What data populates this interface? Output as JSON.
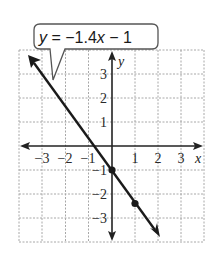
{
  "figure": {
    "equation": {
      "y_var": "y",
      "equals": " = −1.4",
      "x_var": "x",
      "rest": " − 1"
    },
    "axes": {
      "x_label": "x",
      "y_label": "y",
      "x_ticks": [
        "−3",
        "−2",
        "−1",
        "1",
        "2",
        "3"
      ],
      "y_ticks": [
        "3",
        "2",
        "1",
        "−1",
        "−2",
        "−3"
      ]
    },
    "line": {
      "slope": -1.4,
      "intercept": -1,
      "points": [
        {
          "x": 0,
          "y": -1
        },
        {
          "x": 1,
          "y": -2.4
        }
      ]
    },
    "grid": {
      "x_range": [
        -4,
        4
      ],
      "y_range": [
        -4,
        4
      ]
    },
    "colors": {
      "grid": "#a8a8a8",
      "axis": "#222222",
      "line": "#1a1a1a"
    }
  }
}
